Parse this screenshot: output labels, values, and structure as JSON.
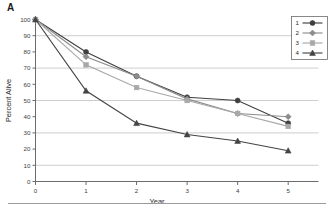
{
  "panel": {
    "label": "A"
  },
  "chart_data": {
    "type": "line",
    "title": "",
    "xlabel": "Year",
    "ylabel": "Percent Alive",
    "x": [
      0,
      1,
      2,
      3,
      4,
      5
    ],
    "xlim": [
      0,
      5.6
    ],
    "ylim": [
      0,
      100
    ],
    "xticks": [
      0,
      1,
      2,
      3,
      4,
      5
    ],
    "xticklabels": [
      "0",
      "1",
      "2",
      "3",
      "4",
      "5"
    ],
    "yticks": [
      0,
      10,
      20,
      30,
      40,
      50,
      60,
      70,
      80,
      90,
      100
    ],
    "yticklabels": [
      "0",
      "10",
      "20",
      "30",
      "40",
      "50",
      "60",
      "70",
      "80",
      "90",
      "100"
    ],
    "gridlines_y": [
      10,
      30,
      50,
      70,
      90
    ],
    "grid": "horizontal",
    "legend_position": "upper-right",
    "series": [
      {
        "name": "1",
        "marker": "circle",
        "color": "#3f3f3f",
        "values": [
          100,
          80,
          65,
          52,
          50,
          36
        ]
      },
      {
        "name": "2",
        "marker": "diamond",
        "color": "#8c8c8c",
        "values": [
          100,
          77,
          65,
          51,
          42,
          40
        ]
      },
      {
        "name": "3",
        "marker": "square",
        "color": "#a8a8a8",
        "values": [
          100,
          72,
          58,
          50,
          42,
          34
        ]
      },
      {
        "name": "4",
        "marker": "triangle",
        "color": "#444444",
        "values": [
          100,
          56,
          36,
          29,
          25,
          19
        ]
      }
    ]
  },
  "legend": {
    "entries": [
      {
        "label": "1"
      },
      {
        "label": "2"
      },
      {
        "label": "3"
      },
      {
        "label": "4"
      }
    ]
  }
}
